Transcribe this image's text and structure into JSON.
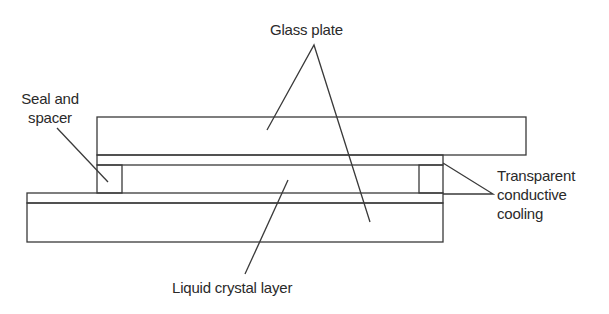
{
  "diagram": {
    "labels": {
      "glass_plate": "Glass plate",
      "seal_line1": "Seal and",
      "seal_line2": "spacer",
      "tcc_line1": "Transparent",
      "tcc_line2": "conductive",
      "tcc_line3": "cooling",
      "liquid_crystal": "Liquid crystal layer"
    },
    "colors": {
      "stroke": "#3a3a3a",
      "text": "#2a2a2a",
      "background": "#ffffff"
    },
    "components": [
      {
        "id": "top-glass-plate",
        "x": 97,
        "y": 117,
        "w": 429,
        "h": 38
      },
      {
        "id": "top-conductive-coating",
        "x": 97,
        "y": 155,
        "w": 346,
        "h": 10
      },
      {
        "id": "left-seal-spacer",
        "x": 97,
        "y": 165,
        "w": 25,
        "h": 28
      },
      {
        "id": "right-seal-spacer",
        "x": 419,
        "y": 165,
        "w": 24,
        "h": 28
      },
      {
        "id": "liquid-crystal-layer",
        "x": 122,
        "y": 165,
        "w": 297,
        "h": 28
      },
      {
        "id": "bottom-conductive-coating",
        "x": 27,
        "y": 193,
        "w": 416,
        "h": 10
      },
      {
        "id": "bottom-glass-plate",
        "x": 27,
        "y": 203,
        "w": 416,
        "h": 39
      }
    ]
  }
}
